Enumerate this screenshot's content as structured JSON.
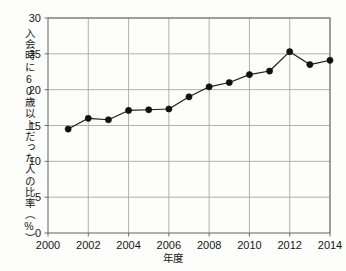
{
  "chart_data": {
    "type": "line",
    "title": "",
    "subtitle": "",
    "xlabel": "年度",
    "ylabel": "入会時に60歳以上だった人の比率（%）",
    "x": [
      2001,
      2002,
      2003,
      2004,
      2005,
      2006,
      2007,
      2008,
      2009,
      2010,
      2011,
      2012,
      2013,
      2014
    ],
    "values": [
      14.5,
      16.0,
      15.8,
      17.1,
      17.2,
      17.3,
      19.0,
      20.4,
      21.0,
      22.1,
      22.6,
      25.3,
      23.5,
      24.1
    ],
    "series": [
      {
        "name": "入会時に60歳以上だった人の比率",
        "values": [
          14.5,
          16.0,
          15.8,
          17.1,
          17.2,
          17.3,
          19.0,
          20.4,
          21.0,
          22.1,
          22.6,
          25.3,
          23.5,
          24.1
        ]
      }
    ],
    "xlim": [
      2000,
      2014
    ],
    "ylim": [
      0,
      30
    ],
    "xticks": [
      2000,
      2002,
      2004,
      2006,
      2008,
      2010,
      2012,
      2014
    ],
    "xticklabels": [
      "2000",
      "2002",
      "2004",
      "2006",
      "2008",
      "2010",
      "2012",
      "2014"
    ],
    "yticks": [
      0,
      5,
      10,
      15,
      20,
      25,
      30
    ],
    "yticklabels": [
      "0",
      "5",
      "10",
      "15",
      "20",
      "25",
      "30"
    ],
    "grid": true,
    "legend": null,
    "annotations": [],
    "colors": {
      "line": "#1a1a1a",
      "marker": "#111111",
      "grid": "#a8a8a8",
      "axis": "#6f6f6f",
      "background": "#fdfdfb",
      "text": "#151515"
    },
    "marker": "circle",
    "marker_size": 3.1,
    "line_width": 1.2
  }
}
